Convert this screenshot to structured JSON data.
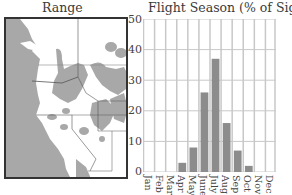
{
  "map": {
    "title": "Range",
    "land_color": "#ffffff",
    "ocean_color": "#a8a8a8",
    "range_color": "#a8a8a8",
    "border_color": "#555555"
  },
  "chart_data": {
    "type": "bar",
    "title": "Flight Season (% of Sightings)",
    "xlabel": "",
    "ylabel": "",
    "categories": [
      "Jan",
      "Feb",
      "Mar",
      "Apr",
      "May",
      "June",
      "July",
      "Aug",
      "Sep",
      "Oct",
      "Nov",
      "Dec"
    ],
    "values": [
      0,
      0,
      0,
      3,
      8,
      26,
      37,
      16,
      7,
      2,
      0,
      0
    ],
    "ylim": [
      0,
      50
    ],
    "yticks": [
      0,
      10,
      20,
      30,
      40,
      50
    ],
    "grid": true,
    "legend": null,
    "bar_color": "#8c8c8c",
    "grid_color": "#c8c8c8"
  }
}
